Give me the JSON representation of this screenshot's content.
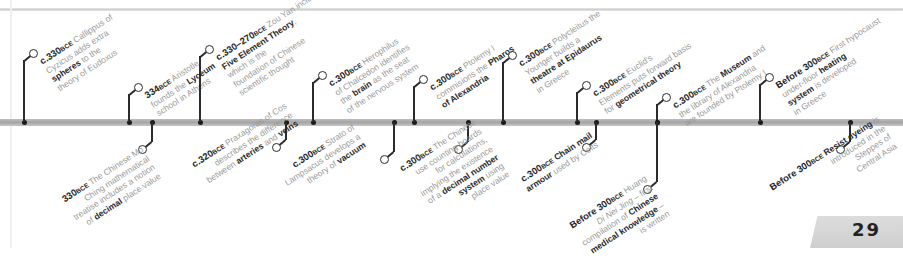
{
  "page": {
    "number": "29"
  },
  "timeline": {
    "above": [
      {
        "x": 24,
        "date": "c.330",
        "era": "BCE",
        "lines": [
          "Callippus of",
          "Cyzicus adds extra",
          "{spheres} to the",
          "theory of Eudoxus"
        ]
      },
      {
        "x": 129,
        "date": "334",
        "era": "BCE",
        "lines": [
          "Aristotle",
          "founds the {Lyceum}",
          "school in Athens"
        ]
      },
      {
        "x": 200,
        "date": "c.330–270",
        "era": "BCE",
        "lines": [
          "Zou Yan includes",
          "{Five Element Theory},",
          "which is the",
          "foundation of Chinese",
          "scientific thought"
        ]
      },
      {
        "x": 313,
        "date": "c.300",
        "era": "BCE",
        "lines": [
          "Herophilus",
          "of Chalcedon identifies",
          "the {brain} as the seat",
          "of the nervous system"
        ]
      },
      {
        "x": 414,
        "date": "c.300",
        "era": "BCE",
        "lines": [
          "Ptolemy I",
          "commisions the {Pharos}",
          "{of Alexandria}"
        ]
      },
      {
        "x": 503,
        "date": "c.300",
        "era": "BCE",
        "lines": [
          "Polycleitus the",
          "Younger builds a",
          "{theatre at Epidaurus}",
          "in Greece"
        ]
      },
      {
        "x": 577,
        "date": "c.300",
        "era": "BCE",
        "lines": [
          "Euclid's",
          "Elements puts forward basis",
          "for {geometrical theory}"
        ]
      },
      {
        "x": 657,
        "date": "c.300",
        "era": "BCE",
        "lines": [
          "The {Museum} and",
          "the library of Alexandria",
          "are founded by Ptolemy I"
        ]
      },
      {
        "x": 760,
        "date": "Before 300",
        "era": "BCE",
        "lines": [
          "First hypocaust",
          "under-floor {heating}",
          "{system} is developed",
          "in Greece"
        ]
      }
    ],
    "below": [
      {
        "x": 152,
        "date": "330",
        "era": "BCE",
        "lines": [
          "The Chinese Mo",
          "Ching mathematical",
          "treatise includes a notion",
          "of {decimal} place value"
        ]
      },
      {
        "x": 286,
        "date": "c.320",
        "era": "BCE",
        "lines": [
          "Praxagoras of Cos",
          "describes the difference",
          "between {arteries} and {veins}"
        ]
      },
      {
        "x": 394,
        "date": "c.300",
        "era": "BCE",
        "lines": [
          "Strato of",
          "Lampsacus develops a",
          "theory of {vacuum}"
        ]
      },
      {
        "x": 468,
        "date": "c.300",
        "era": "BCE",
        "lines": [
          "The Chinese",
          "use counting boards",
          "for calculations,",
          "implying the existence",
          "of a {decimal number}",
          "{system} using",
          "place value"
        ]
      },
      {
        "x": 596,
        "date": "c.300",
        "era": "BCE",
        "lines": [
          "{Chain mail}",
          "{armour} used by Celts"
        ]
      },
      {
        "x": 850,
        "date": "Before 300",
        "era": "BCE",
        "lines": [
          "{Resist dyeing} is",
          "introduced in the",
          "Steppes of",
          "Central Asia"
        ]
      }
    ],
    "below_extra": {
      "huang": {
        "x": 657,
        "date": "Before 300",
        "era": "BCE",
        "lines": [
          "Huang",
          "[Di Nei Jing] – first",
          "compilation of {Chinese}",
          "{medical knowledge} –",
          "is written"
        ]
      }
    }
  }
}
